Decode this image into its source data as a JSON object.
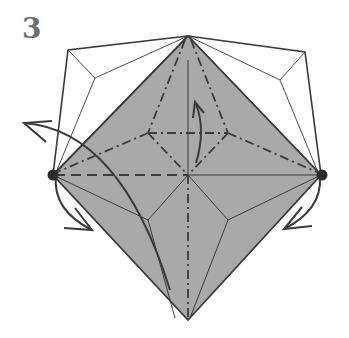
{
  "diagram": {
    "step_number": "3",
    "type": "origami-fold-step",
    "colors": {
      "paper_colored": "#a9a9a9",
      "paper_white": "#ffffff",
      "line": "#3a3a3a",
      "step_number": "#6e6e6e"
    },
    "symbols": [
      {
        "name": "pivot-dot-left",
        "meaning": "hold point"
      },
      {
        "name": "pivot-dot-right",
        "meaning": "hold point"
      },
      {
        "name": "valley-fold-lines",
        "meaning": "dashed lines"
      },
      {
        "name": "mountain-fold-lines",
        "meaning": "dash-dot lines"
      },
      {
        "name": "fold-arrow-center",
        "meaning": "fold up"
      },
      {
        "name": "fold-arrow-left",
        "meaning": "swing behind/open"
      },
      {
        "name": "fold-arrow-right",
        "meaning": "swing down"
      }
    ]
  }
}
